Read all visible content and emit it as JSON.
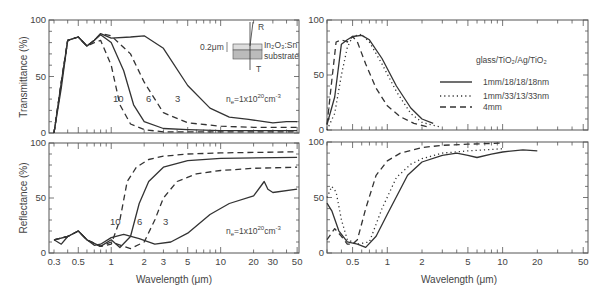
{
  "chart_data": [
    {
      "type": "line",
      "panel": "top-left",
      "ylabel": "Transmittance (%)",
      "xlabel": "",
      "xscale": "log",
      "xlim": [
        0.27,
        52
      ],
      "ylim": [
        0,
        100
      ],
      "yticks": [
        "0",
        "50",
        "100"
      ],
      "annotation": "n_e=1x10^20 cm^-3",
      "inset": {
        "thickness": "0.2μm",
        "film": "In2O3:Sn",
        "substrate": "substrate",
        "R": "R",
        "T": "T"
      },
      "curve_labels": [
        "10",
        "6",
        "3"
      ],
      "series": [
        {
          "name": "1",
          "style": "solid",
          "x": [
            0.3,
            0.35,
            0.4,
            0.5,
            0.6,
            0.7,
            0.8,
            1.0,
            1.5,
            2.0,
            3.0,
            5.0,
            8.0,
            12,
            18,
            25,
            30,
            40,
            50
          ],
          "y": [
            0,
            40,
            82,
            85,
            77,
            82,
            88,
            84,
            85,
            86,
            75,
            42,
            22,
            14,
            12,
            10,
            9,
            10,
            10
          ]
        },
        {
          "name": "3",
          "style": "dashed",
          "x": [
            0.3,
            0.35,
            0.4,
            0.5,
            0.6,
            0.7,
            0.8,
            1.0,
            1.5,
            2.0,
            3.0,
            5.0,
            10,
            20,
            50
          ],
          "y": [
            0,
            45,
            82,
            85,
            77,
            82,
            88,
            86,
            70,
            45,
            18,
            9,
            6,
            5,
            5
          ]
        },
        {
          "name": "6",
          "style": "solid",
          "x": [
            0.3,
            0.35,
            0.4,
            0.5,
            0.6,
            0.7,
            0.8,
            1.0,
            1.3,
            1.6,
            2.0,
            3.0,
            5.0,
            10,
            50
          ],
          "y": [
            0,
            45,
            82,
            85,
            77,
            82,
            87,
            80,
            55,
            25,
            10,
            4,
            3,
            2,
            2
          ]
        },
        {
          "name": "10",
          "style": "dashed",
          "x": [
            0.3,
            0.35,
            0.4,
            0.5,
            0.6,
            0.7,
            0.8,
            1.0,
            1.2,
            1.5,
            2.0,
            3.0,
            5,
            50
          ],
          "y": [
            0,
            45,
            82,
            85,
            77,
            80,
            82,
            60,
            25,
            8,
            3,
            1,
            1,
            1
          ]
        }
      ]
    },
    {
      "type": "line",
      "panel": "bottom-left",
      "ylabel": "Reflectance (%)",
      "xlabel": "Wavelength (μm)",
      "xscale": "log",
      "xlim": [
        0.27,
        52
      ],
      "ylim": [
        0,
        100
      ],
      "xticks": [
        "0.3",
        "0.5",
        "1",
        "2",
        "3",
        "5",
        "10",
        "20",
        "30",
        "50"
      ],
      "yticks": [
        "0",
        "50",
        "100"
      ],
      "annotation": "n_e=1x10^20 cm^-3",
      "curve_labels": [
        "10",
        "6",
        "3"
      ],
      "series": [
        {
          "name": "1",
          "style": "solid",
          "x": [
            0.3,
            0.35,
            0.4,
            0.5,
            0.6,
            0.7,
            0.8,
            1.0,
            1.3,
            1.8,
            2.5,
            3.5,
            5,
            8,
            12,
            20,
            23,
            25,
            27,
            30,
            50
          ],
          "y": [
            12,
            8,
            15,
            20,
            12,
            7,
            8,
            14,
            17,
            13,
            8,
            10,
            18,
            35,
            45,
            52,
            60,
            65,
            58,
            55,
            58
          ]
        },
        {
          "name": "3",
          "style": "dashed",
          "x": [
            0.3,
            0.4,
            0.5,
            0.6,
            0.8,
            1.0,
            1.5,
            2.0,
            2.5,
            3.0,
            4.0,
            6.0,
            10,
            20,
            50
          ],
          "y": [
            12,
            15,
            20,
            12,
            6,
            10,
            4,
            10,
            30,
            50,
            65,
            72,
            75,
            77,
            78
          ]
        },
        {
          "name": "6",
          "style": "solid",
          "x": [
            0.3,
            0.4,
            0.5,
            0.6,
            0.8,
            1.0,
            1.2,
            1.5,
            1.8,
            2.2,
            3.0,
            5.0,
            10,
            50
          ],
          "y": [
            12,
            15,
            20,
            12,
            6,
            12,
            5,
            15,
            45,
            65,
            78,
            84,
            86,
            87
          ]
        },
        {
          "name": "10",
          "style": "dashed",
          "x": [
            0.3,
            0.4,
            0.5,
            0.6,
            0.8,
            1.0,
            1.2,
            1.4,
            1.7,
            2.2,
            3.0,
            5.0,
            10,
            50
          ],
          "y": [
            12,
            15,
            20,
            12,
            6,
            8,
            30,
            65,
            78,
            85,
            88,
            90,
            91,
            92
          ]
        }
      ]
    },
    {
      "type": "line",
      "panel": "top-right",
      "xscale": "log",
      "xlim": [
        0.3,
        55
      ],
      "ylim": [
        0,
        100
      ],
      "yticks": [
        "0",
        "50",
        "100"
      ],
      "legend_title": "glass/TiO2/Ag/TiO2",
      "legend_position": "right",
      "series": [
        {
          "name": "1mm/18/18/18nm",
          "style": "solid",
          "x": [
            0.3,
            0.35,
            0.4,
            0.45,
            0.5,
            0.6,
            0.7,
            0.9,
            1.2,
            1.6,
            2.0,
            2.5
          ],
          "y": [
            5,
            30,
            78,
            82,
            85,
            86,
            82,
            65,
            40,
            20,
            10,
            6
          ]
        },
        {
          "name": "1mm/33/13/33nm",
          "style": "dotted",
          "x": [
            0.3,
            0.35,
            0.4,
            0.45,
            0.5,
            0.6,
            0.7,
            0.9,
            1.2,
            1.6,
            2.0,
            2.8
          ],
          "y": [
            0,
            15,
            50,
            75,
            85,
            87,
            80,
            60,
            35,
            15,
            7,
            3
          ]
        },
        {
          "name": "4mm",
          "style": "dashed",
          "x": [
            0.3,
            0.33,
            0.36,
            0.4,
            0.45,
            0.5,
            0.55,
            0.65,
            0.8,
            1.0,
            1.3,
            1.7,
            2.2
          ],
          "y": [
            5,
            45,
            80,
            82,
            80,
            85,
            80,
            60,
            38,
            22,
            12,
            6,
            3
          ]
        }
      ]
    },
    {
      "type": "line",
      "panel": "bottom-right",
      "xlabel": "Wavelength (μm)",
      "xscale": "log",
      "xlim": [
        0.3,
        55
      ],
      "ylim": [
        0,
        100
      ],
      "xticks": [
        "0.5",
        "1",
        "2",
        "5",
        "10",
        "20",
        "50"
      ],
      "yticks": [
        "0",
        "50",
        "100"
      ],
      "series": [
        {
          "name": "1mm/18/18/18nm",
          "style": "solid",
          "x": [
            0.3,
            0.33,
            0.38,
            0.45,
            0.55,
            0.65,
            0.8,
            1.0,
            1.5,
            2.0,
            3.0,
            4.0,
            5.0,
            6.0,
            8.0,
            10,
            15,
            20
          ],
          "y": [
            45,
            38,
            20,
            10,
            8,
            5,
            15,
            35,
            70,
            82,
            88,
            90,
            88,
            86,
            89,
            91,
            93,
            92
          ]
        },
        {
          "name": "1mm/33/13/33nm",
          "style": "dotted",
          "x": [
            0.3,
            0.33,
            0.36,
            0.4,
            0.45,
            0.55,
            0.7,
            0.9,
            1.2,
            1.6,
            2.0,
            3.0,
            5.0,
            10
          ],
          "y": [
            50,
            60,
            55,
            30,
            12,
            8,
            10,
            40,
            68,
            80,
            85,
            90,
            92,
            94
          ]
        },
        {
          "name": "4mm",
          "style": "dashed",
          "x": [
            0.3,
            0.35,
            0.4,
            0.45,
            0.5,
            0.55,
            0.65,
            0.8,
            1.0,
            1.3,
            2.0,
            3.0,
            5.0,
            10
          ],
          "y": [
            12,
            22,
            15,
            8,
            8,
            12,
            40,
            70,
            83,
            90,
            95,
            97,
            98,
            99
          ]
        }
      ]
    }
  ],
  "labels": {
    "tl_ylabel": "Transmittance (%)",
    "bl_ylabel": "Reflectance (%)",
    "xlabel": "Wavelength (μm)",
    "annot_ne": "n",
    "annot_ne_sub": "e",
    "annot_eq": "=1x10",
    "annot_exp": "20",
    "annot_unit": "cm",
    "annot_unit_exp": "-3",
    "inset_thick": "0.2μm",
    "inset_film": "In₂O₃:Sn",
    "inset_sub": "substrate",
    "inset_R": "R",
    "inset_T": "T",
    "legend_title": "glass/TiO₂/Ag/TiO₂",
    "legend_1": "1mm/18/18/18nm",
    "legend_2": "1mm/33/13/33nm",
    "legend_3": "4mm",
    "c10": "10",
    "c6": "6",
    "c3": "3",
    "y0": "0",
    "y50": "50",
    "y100": "100"
  }
}
